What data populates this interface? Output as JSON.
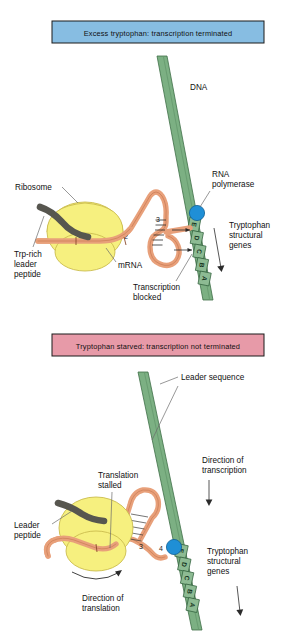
{
  "figure": {
    "colors": {
      "dna_green": "#7cb083",
      "dna_green_dark": "#4f8759",
      "mrna_orange": "#e8a07a",
      "mrna_outline": "#b5613a",
      "ribosome_yellow": "#f6f07f",
      "ribosome_outline": "#c9b94a",
      "peptide_gray": "#57564f",
      "polymerase_blue": "#1f8fd6",
      "banner_blue": "#87bde2",
      "banner_pink": "#e79aa8",
      "banner_border": "#1b1b1b",
      "leader_line": "#6b6b6b"
    }
  },
  "panels": [
    {
      "id": "excess-tryptophan",
      "banner": "Excess tryptophan:  transcription terminated",
      "banner_color": "#87bde2",
      "labels": {
        "dna": "DNA",
        "ribosome": "Ribosome",
        "trp_rich_leader_peptide": "Trp-rich\nleader\npeptide",
        "trp_rich_line1": "Trp-rich",
        "trp_rich_line2": "leader",
        "trp_rich_line3": "peptide",
        "mrna": "mRNA",
        "rna_polymerase_line1": "RNA",
        "rna_polymerase_line2": "polymerase",
        "tryptophan_structural_genes_line1": "Tryptophan",
        "tryptophan_structural_genes_line2": "structural",
        "tryptophan_structural_genes_line3": "genes",
        "transcription_blocked_line1": "Transcription",
        "transcription_blocked_line2": "blocked"
      },
      "genes": [
        "E",
        "D",
        "C",
        "B",
        "A"
      ],
      "mrna_segments": [
        "1",
        "2",
        "3"
      ]
    },
    {
      "id": "tryptophan-starved",
      "banner": "Tryptophan starved:  transcription not terminated",
      "banner_color": "#e79aa8",
      "labels": {
        "leader_sequence": "Leader sequence",
        "direction_of_transcription_line1": "Direction of",
        "direction_of_transcription_line2": "transcription",
        "translation_stalled_line1": "Translation",
        "translation_stalled_line2": "stalled",
        "leader_peptide_line1": "Leader",
        "leader_peptide_line2": "peptide",
        "tryptophan_structural_genes_line1": "Tryptophan",
        "tryptophan_structural_genes_line2": "structural",
        "tryptophan_structural_genes_line3": "genes",
        "direction_of_translation_line1": "Direction of",
        "direction_of_translation_line2": "translation"
      },
      "genes": [
        "E",
        "D",
        "C",
        "B",
        "A"
      ],
      "mrna_segments": [
        "2",
        "3",
        "4"
      ]
    }
  ]
}
